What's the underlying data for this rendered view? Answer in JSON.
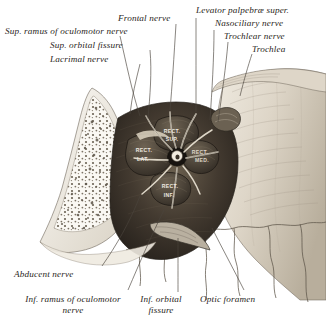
{
  "figure": {
    "background_color": "#ffffff",
    "ink_color": "#2a2622",
    "width": 326,
    "height": 328
  },
  "labels": {
    "top_left": [
      {
        "text": "Sup. ramus of oculomotor nerve",
        "x": 5,
        "y": 30,
        "align": "left"
      },
      {
        "text": "Sup. orbital fissure",
        "x": 50,
        "y": 45,
        "align": "left"
      },
      {
        "text": "Lacrimal nerve",
        "x": 50,
        "y": 59,
        "align": "left"
      }
    ],
    "top_center": [
      {
        "text": "Frontal nerve",
        "x": 118,
        "y": 16,
        "align": "left"
      }
    ],
    "top_right": [
      {
        "text": "Levator palpebræ super.",
        "x": 196,
        "y": 8,
        "align": "left"
      },
      {
        "text": "Nasociliary nerve",
        "x": 215,
        "y": 21,
        "align": "left"
      },
      {
        "text": "Trochlear nerve",
        "x": 224,
        "y": 34,
        "align": "left"
      },
      {
        "text": "Trochlea",
        "x": 250,
        "y": 47,
        "align": "left"
      }
    ],
    "bottom": [
      {
        "text": "Abducent nerve",
        "x": 14,
        "y": 272,
        "align": "left"
      },
      {
        "text": "Inf. ramus of oculomotor\nnerve",
        "x": 8,
        "y": 298,
        "align": "left"
      },
      {
        "text": "Inf. orbital\nfissure",
        "x": 130,
        "y": 298,
        "align": "left"
      },
      {
        "text": "Optic foramen",
        "x": 200,
        "y": 298,
        "align": "left"
      }
    ]
  },
  "muscle_labels": [
    {
      "text": "RECT.",
      "x": 172,
      "y": 131,
      "id": "rectus-superior-line1"
    },
    {
      "text": "SUP.",
      "x": 172,
      "y": 139,
      "id": "rectus-superior-line2"
    },
    {
      "text": "RECT.",
      "x": 142,
      "y": 150,
      "id": "rectus-lateralis-line1"
    },
    {
      "text": "LAT.",
      "x": 141,
      "y": 159,
      "id": "rectus-lateralis-line2"
    },
    {
      "text": "RECT.",
      "x": 197,
      "y": 152,
      "id": "rectus-medialis-line1"
    },
    {
      "text": "MED.",
      "x": 199,
      "y": 160,
      "id": "rectus-medialis-line2"
    },
    {
      "text": "RECT.",
      "x": 169,
      "y": 186,
      "id": "rectus-inferior-line1"
    },
    {
      "text": "INF.",
      "x": 168,
      "y": 195,
      "id": "rectus-inferior-line2"
    }
  ],
  "colors": {
    "bone_light": "#f4f1ea",
    "bone_mid": "#cfc7b8",
    "bone_shadow": "#9c9383",
    "muscle_dark": "#3b342c",
    "muscle_mid": "#5d5344",
    "cavity": "#2b2620",
    "line": "#4a443c"
  }
}
